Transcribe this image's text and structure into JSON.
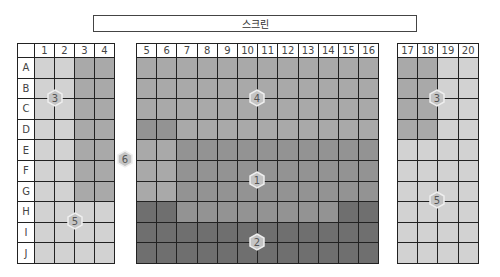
{
  "screen_label": "스크린",
  "row_labels": [
    "A",
    "B",
    "C",
    "D",
    "E",
    "F",
    "G",
    "H",
    "I",
    "J"
  ],
  "sections": {
    "left": {
      "columns": [
        "1",
        "2",
        "3",
        "4"
      ]
    },
    "center": {
      "columns": [
        "5",
        "6",
        "7",
        "8",
        "9",
        "10",
        "11",
        "12",
        "13",
        "14",
        "15",
        "16"
      ]
    },
    "right": {
      "columns": [
        "17",
        "18",
        "19",
        "20"
      ]
    }
  },
  "zones": {
    "1": "1",
    "2": "2",
    "3a": "3",
    "3b": "3",
    "4": "4",
    "5a": "5",
    "5b": "5",
    "6": "6"
  },
  "colors": {
    "light": "#d2d2d2",
    "medium": "#a9a9a9",
    "medium_dark": "#939393",
    "dark": "#6f6f6f",
    "grid_line": "#222222"
  }
}
